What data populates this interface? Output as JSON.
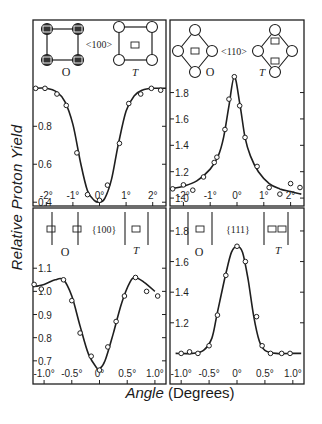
{
  "figure": {
    "ylabel": "Relative Proton Yield",
    "xlabel_italic": "Angle",
    "xlabel_rest": " (Degrees)"
  },
  "chart_data": [
    {
      "type": "line",
      "panel": "top-left",
      "title": "<100>",
      "site_labels": [
        "O",
        "T"
      ],
      "xlabel": "Angle (Degrees)",
      "ylabel": "Relative Proton Yield",
      "xticks": [
        "-2°",
        "-1°",
        "0°",
        "1°",
        "2°"
      ],
      "xtick_values": [
        -2,
        -1,
        0,
        1,
        2
      ],
      "yticks": [
        "0.4",
        "0.6",
        "0.8"
      ],
      "ytick_values": [
        0.4,
        0.6,
        0.8
      ],
      "xlim": [
        -2.5,
        2.5
      ],
      "ylim": [
        0.38,
        1.36
      ],
      "points": {
        "x": [
          -2.4,
          -2.05,
          -1.6,
          -1.25,
          -0.85,
          -0.45,
          0.0,
          0.3,
          0.75,
          1.1,
          1.55,
          1.95,
          2.3
        ],
        "y": [
          1.0,
          1.0,
          0.97,
          0.91,
          0.66,
          0.44,
          0.41,
          0.49,
          0.71,
          0.92,
          0.97,
          1.0,
          0.99
        ]
      },
      "curve": {
        "x": [
          -2.5,
          -2.0,
          -1.6,
          -1.3,
          -1.0,
          -0.7,
          -0.45,
          -0.2,
          0.0,
          0.2,
          0.45,
          0.7,
          1.0,
          1.3,
          1.6,
          2.0,
          2.5
        ],
        "y": [
          1.0,
          1.0,
          0.98,
          0.93,
          0.81,
          0.6,
          0.46,
          0.41,
          0.4,
          0.42,
          0.52,
          0.7,
          0.88,
          0.96,
          0.99,
          1.0,
          1.0
        ]
      }
    },
    {
      "type": "line",
      "panel": "top-right",
      "title": "<110>",
      "site_labels": [
        "O",
        "T"
      ],
      "xticks": [
        "-2°",
        "-1°",
        "0°",
        "1°",
        "2°"
      ],
      "xtick_values": [
        -2,
        -1,
        0,
        1,
        2
      ],
      "yticks": [
        "1.0",
        "1.2",
        "1.4",
        "1.6",
        "1.8"
      ],
      "ytick_values": [
        1.0,
        1.2,
        1.4,
        1.6,
        1.8
      ],
      "xlim": [
        -2.5,
        2.5
      ],
      "ylim": [
        0.94,
        2.35
      ],
      "points": {
        "x": [
          -2.4,
          -2.0,
          -1.65,
          -1.25,
          -0.85,
          -0.75,
          -0.45,
          -0.3,
          -0.1,
          0.1,
          0.3,
          0.75,
          1.2,
          1.6,
          2.0,
          2.35
        ],
        "y": [
          1.07,
          1.1,
          1.06,
          1.16,
          1.27,
          1.31,
          1.52,
          1.75,
          1.92,
          1.7,
          1.46,
          1.24,
          1.08,
          1.03,
          1.11,
          1.08
        ]
      },
      "curve": {
        "x": [
          -2.5,
          -2.0,
          -1.5,
          -1.0,
          -0.7,
          -0.5,
          -0.3,
          -0.1,
          0.1,
          0.3,
          0.5,
          0.8,
          1.2,
          1.6,
          2.0,
          2.4
        ],
        "y": [
          1.07,
          1.09,
          1.13,
          1.22,
          1.32,
          1.46,
          1.7,
          1.92,
          1.72,
          1.46,
          1.32,
          1.2,
          1.11,
          1.07,
          1.05,
          1.03
        ]
      }
    },
    {
      "type": "line",
      "panel": "bottom-left",
      "title": "{100}",
      "site_labels": [
        "O",
        "T"
      ],
      "xticks": [
        "-1.0°",
        "-0.5°",
        "0°",
        "0.5°",
        "1.0°"
      ],
      "xtick_values": [
        -1.0,
        -0.5,
        0,
        0.5,
        1.0
      ],
      "yticks": [
        "0.7",
        "0.8",
        "0.9",
        "1.0",
        "1.1"
      ],
      "ytick_values": [
        0.7,
        0.8,
        0.9,
        1.0,
        1.1
      ],
      "xlim": [
        -1.2,
        1.2
      ],
      "ylim": [
        0.6,
        1.36
      ],
      "points": {
        "x": [
          -1.18,
          -1.05,
          -0.65,
          -0.5,
          -0.35,
          -0.15,
          0.0,
          0.15,
          0.3,
          0.45,
          0.65,
          0.85,
          1.05
        ],
        "y": [
          1.03,
          1.01,
          1.05,
          0.96,
          0.82,
          0.72,
          0.66,
          0.76,
          0.87,
          0.98,
          1.06,
          1.0,
          0.98
        ]
      },
      "curve": {
        "x": [
          -1.2,
          -1.0,
          -0.8,
          -0.65,
          -0.5,
          -0.35,
          -0.2,
          -0.05,
          0.0,
          0.1,
          0.25,
          0.4,
          0.55,
          0.65,
          0.8,
          1.0
        ],
        "y": [
          1.02,
          1.03,
          1.05,
          1.05,
          0.98,
          0.85,
          0.73,
          0.67,
          0.665,
          0.7,
          0.82,
          0.95,
          1.04,
          1.06,
          1.04,
          1.0
        ]
      }
    },
    {
      "type": "line",
      "panel": "bottom-right",
      "title": "{111}",
      "site_labels": [
        "O",
        "T"
      ],
      "xticks": [
        "-1.0°",
        "-0.5°",
        "0°",
        "0.5°",
        "1.0°"
      ],
      "xtick_values": [
        -1.0,
        -0.5,
        0,
        0.5,
        1.0
      ],
      "yticks": [
        "1.2",
        "1.4",
        "1.6",
        "1.8"
      ],
      "ytick_values": [
        1.2,
        1.4,
        1.6,
        1.8
      ],
      "xlim": [
        -1.2,
        1.2
      ],
      "ylim": [
        0.8,
        1.95
      ],
      "points": {
        "x": [
          -1.0,
          -0.85,
          -0.7,
          -0.5,
          -0.35,
          -0.2,
          0.0,
          0.15,
          0.35,
          0.45,
          0.6,
          0.8,
          0.95
        ],
        "y": [
          1.0,
          1.01,
          1.0,
          1.05,
          1.25,
          1.51,
          1.7,
          1.6,
          1.24,
          1.05,
          1.0,
          1.0,
          1.0
        ]
      },
      "curve": {
        "x": [
          -1.1,
          -0.8,
          -0.6,
          -0.45,
          -0.35,
          -0.2,
          -0.1,
          0.0,
          0.1,
          0.2,
          0.3,
          0.4,
          0.5,
          0.7,
          1.0,
          1.15
        ],
        "y": [
          1.0,
          1.0,
          1.02,
          1.1,
          1.27,
          1.52,
          1.66,
          1.7,
          1.66,
          1.48,
          1.24,
          1.08,
          1.02,
          1.0,
          1.0,
          1.0
        ]
      }
    }
  ]
}
